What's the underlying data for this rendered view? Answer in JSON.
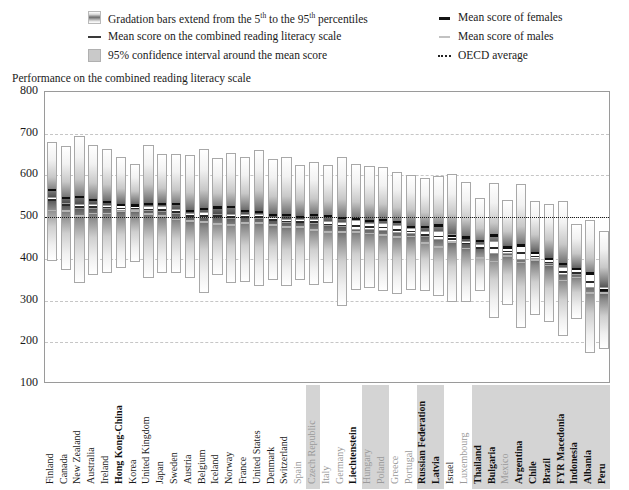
{
  "legend": {
    "items_left": [
      {
        "swatch": "gradient-swatch",
        "text_html": "Gradation bars extend from the 5th to the 95th percentiles",
        "text": "Gradation bars extend from the 5",
        "sup1": "th",
        "mid": " to the 95",
        "sup2": "th",
        "tail": " percentiles"
      },
      {
        "swatch": "mean-line-swatch",
        "text": "Mean score on the combined reading literacy scale"
      },
      {
        "swatch": "confidence-interval-swatch",
        "text": "95% confidence interval around the mean score"
      }
    ],
    "items_right": [
      {
        "swatch": "female-mean-swatch",
        "text": "Mean score of females"
      },
      {
        "swatch": "male-mean-swatch",
        "text": "Mean score of males"
      },
      {
        "swatch": "oecd-average-swatch",
        "text": "OECD average"
      }
    ]
  },
  "axis_title": "Performance on the combined reading literacy scale",
  "chart_data": {
    "type": "bar",
    "title": "Performance on the combined reading literacy scale",
    "subtitle": "PISA 2000 — combined reading literacy scale, 5th to 95th percentile gradation bars",
    "xlabel": "",
    "ylabel": "Performance on the combined reading literacy scale",
    "ylim": [
      100,
      800
    ],
    "yticks": [
      100,
      200,
      300,
      400,
      500,
      600,
      700,
      800
    ],
    "grid": true,
    "legend_position": "top",
    "oecd_average": 500,
    "value_keys": [
      "p5",
      "p95",
      "mean",
      "ci_low",
      "ci_high",
      "female",
      "male"
    ],
    "categories": [
      "Finland",
      "Canada",
      "New Zealand",
      "Australia",
      "Ireland",
      "Hong Kong-China",
      "Korea",
      "United Kingdom",
      "Japan",
      "Sweden",
      "Austria",
      "Belgium",
      "Iceland",
      "Norway",
      "France",
      "United States",
      "Denmark",
      "Switzerland",
      "Spain",
      "Czech Republic",
      "Italy",
      "Germany",
      "Liechtenstein",
      "Hungary",
      "Poland",
      "Greece",
      "Portugal",
      "Russian Federation",
      "Latvia",
      "Israel",
      "Luxembourg",
      "Thailand",
      "Bulgaria",
      "Mexico",
      "Argentina",
      "Chile",
      "Brazil",
      "FYR Macedonia",
      "Indonesia",
      "Albania",
      "Peru"
    ],
    "bold_labels": [
      "Hong Kong-China",
      "Liechtenstein",
      "Russian Federation",
      "Latvia",
      "Thailand",
      "Bulgaria",
      "Argentina",
      "Chile",
      "Brazil",
      "FYR Macedonia",
      "Indonesia",
      "Albania",
      "Peru"
    ],
    "dim_labels": [
      "Hungary",
      "Poland",
      "Greece",
      "Portugal",
      "Luxembourg",
      "Mexico",
      "Italy",
      "Germany",
      "Czech Republic",
      "Spain"
    ],
    "highlight_groups": [
      {
        "from": "Czech Republic",
        "to": "Czech Republic"
      },
      {
        "from": "Hungary",
        "to": "Poland"
      },
      {
        "from": "Russian Federation",
        "to": "Latvia"
      },
      {
        "from": "Thailand",
        "to": "Peru"
      }
    ],
    "rows": [
      {
        "country": "Finland",
        "p5": 394,
        "p95": 681,
        "mean": 546,
        "ci_low": 541,
        "ci_high": 551,
        "female": 571,
        "male": 520
      },
      {
        "country": "Canada",
        "p5": 374,
        "p95": 671,
        "mean": 534,
        "ci_low": 531,
        "ci_high": 537,
        "female": 551,
        "male": 519
      },
      {
        "country": "New Zealand",
        "p5": 341,
        "p95": 694,
        "mean": 529,
        "ci_low": 523,
        "ci_high": 535,
        "female": 553,
        "male": 507
      },
      {
        "country": "Australia",
        "p5": 362,
        "p95": 673,
        "mean": 528,
        "ci_low": 523,
        "ci_high": 533,
        "female": 546,
        "male": 513
      },
      {
        "country": "Ireland",
        "p5": 365,
        "p95": 664,
        "mean": 527,
        "ci_low": 522,
        "ci_high": 532,
        "female": 542,
        "male": 513
      },
      {
        "country": "Hong Kong-China",
        "p5": 379,
        "p95": 645,
        "mean": 525,
        "ci_low": 518,
        "ci_high": 532,
        "female": 534,
        "male": 518
      },
      {
        "country": "Korea",
        "p5": 393,
        "p95": 628,
        "mean": 525,
        "ci_low": 519,
        "ci_high": 531,
        "female": 533,
        "male": 519
      },
      {
        "country": "United Kingdom",
        "p5": 355,
        "p95": 672,
        "mean": 523,
        "ci_low": 518,
        "ci_high": 528,
        "female": 537,
        "male": 512
      },
      {
        "country": "Japan",
        "p5": 366,
        "p95": 652,
        "mean": 522,
        "ci_low": 515,
        "ci_high": 529,
        "female": 537,
        "male": 507
      },
      {
        "country": "Sweden",
        "p5": 367,
        "p95": 652,
        "mean": 516,
        "ci_low": 511,
        "ci_high": 521,
        "female": 536,
        "male": 499
      },
      {
        "country": "Austria",
        "p5": 355,
        "p95": 650,
        "mean": 507,
        "ci_low": 502,
        "ci_high": 512,
        "female": 520,
        "male": 495
      },
      {
        "country": "Belgium",
        "p5": 318,
        "p95": 663,
        "mean": 507,
        "ci_low": 500,
        "ci_high": 514,
        "female": 525,
        "male": 492
      },
      {
        "country": "Iceland",
        "p5": 361,
        "p95": 641,
        "mean": 507,
        "ci_low": 503,
        "ci_high": 511,
        "female": 528,
        "male": 488
      },
      {
        "country": "Norway",
        "p5": 343,
        "p95": 653,
        "mean": 505,
        "ci_low": 499,
        "ci_high": 511,
        "female": 529,
        "male": 486
      },
      {
        "country": "France",
        "p5": 344,
        "p95": 644,
        "mean": 505,
        "ci_low": 500,
        "ci_high": 510,
        "female": 519,
        "male": 490
      },
      {
        "country": "United States",
        "p5": 334,
        "p95": 660,
        "mean": 504,
        "ci_low": 497,
        "ci_high": 511,
        "female": 518,
        "male": 490
      },
      {
        "country": "Denmark",
        "p5": 350,
        "p95": 640,
        "mean": 497,
        "ci_low": 492,
        "ci_high": 502,
        "female": 510,
        "male": 485
      },
      {
        "country": "Switzerland",
        "p5": 336,
        "p95": 644,
        "mean": 494,
        "ci_low": 489,
        "ci_high": 499,
        "female": 510,
        "male": 480
      },
      {
        "country": "Spain",
        "p5": 349,
        "p95": 624,
        "mean": 493,
        "ci_low": 488,
        "ci_high": 498,
        "female": 505,
        "male": 481
      },
      {
        "country": "Czech Republic",
        "p5": 337,
        "p95": 633,
        "mean": 492,
        "ci_low": 486,
        "ci_high": 498,
        "female": 510,
        "male": 473
      },
      {
        "country": "Italy",
        "p5": 342,
        "p95": 625,
        "mean": 487,
        "ci_low": 481,
        "ci_high": 493,
        "female": 507,
        "male": 469
      },
      {
        "country": "Germany",
        "p5": 287,
        "p95": 645,
        "mean": 484,
        "ci_low": 478,
        "ci_high": 490,
        "female": 502,
        "male": 468
      },
      {
        "country": "Liechtenstein",
        "p5": 326,
        "p95": 627,
        "mean": 483,
        "ci_low": 471,
        "ci_high": 495,
        "female": 500,
        "male": 468
      },
      {
        "country": "Hungary",
        "p5": 330,
        "p95": 622,
        "mean": 480,
        "ci_low": 472,
        "ci_high": 488,
        "female": 496,
        "male": 465
      },
      {
        "country": "Poland",
        "p5": 323,
        "p95": 621,
        "mean": 479,
        "ci_low": 470,
        "ci_high": 488,
        "female": 498,
        "male": 461
      },
      {
        "country": "Greece",
        "p5": 316,
        "p95": 609,
        "mean": 474,
        "ci_low": 464,
        "ci_high": 484,
        "female": 493,
        "male": 456
      },
      {
        "country": "Portugal",
        "p5": 325,
        "p95": 602,
        "mean": 470,
        "ci_low": 463,
        "ci_high": 477,
        "female": 482,
        "male": 458
      },
      {
        "country": "Russian Federation",
        "p5": 322,
        "p95": 594,
        "mean": 462,
        "ci_low": 454,
        "ci_high": 470,
        "female": 481,
        "male": 443
      },
      {
        "country": "Latvia",
        "p5": 310,
        "p95": 598,
        "mean": 458,
        "ci_low": 447,
        "ci_high": 469,
        "female": 485,
        "male": 432
      },
      {
        "country": "Israel",
        "p5": 296,
        "p95": 604,
        "mean": 452,
        "ci_low": 442,
        "ci_high": 462,
        "female": 459,
        "male": 445
      },
      {
        "country": "Luxembourg",
        "p5": 296,
        "p95": 585,
        "mean": 441,
        "ci_low": 437,
        "ci_high": 445,
        "female": 456,
        "male": 429
      },
      {
        "country": "Thailand",
        "p5": 324,
        "p95": 546,
        "mean": 431,
        "ci_low": 425,
        "ci_high": 437,
        "female": 448,
        "male": 407
      },
      {
        "country": "Bulgaria",
        "p5": 259,
        "p95": 583,
        "mean": 430,
        "ci_low": 414,
        "ci_high": 446,
        "female": 461,
        "male": 398
      },
      {
        "country": "Mexico",
        "p5": 290,
        "p95": 541,
        "mean": 422,
        "ci_low": 414,
        "ci_high": 430,
        "female": 432,
        "male": 411
      },
      {
        "country": "Argentina",
        "p5": 235,
        "p95": 580,
        "mean": 418,
        "ci_low": 400,
        "ci_high": 436,
        "female": 437,
        "male": 396
      },
      {
        "country": "Chile",
        "p5": 265,
        "p95": 539,
        "mean": 410,
        "ci_low": 402,
        "ci_high": 418,
        "female": 419,
        "male": 401
      },
      {
        "country": "Brazil",
        "p5": 249,
        "p95": 531,
        "mean": 396,
        "ci_low": 389,
        "ci_high": 403,
        "female": 404,
        "male": 388
      },
      {
        "country": "FYR Macedonia",
        "p5": 214,
        "p95": 539,
        "mean": 373,
        "ci_low": 364,
        "ci_high": 382,
        "female": 393,
        "male": 352
      },
      {
        "country": "Indonesia",
        "p5": 255,
        "p95": 483,
        "mean": 371,
        "ci_low": 363,
        "ci_high": 379,
        "female": 380,
        "male": 360
      },
      {
        "country": "Albania",
        "p5": 175,
        "p95": 494,
        "mean": 349,
        "ci_low": 333,
        "ci_high": 365,
        "female": 370,
        "male": 322
      },
      {
        "country": "Peru",
        "p5": 183,
        "p95": 466,
        "mean": 327,
        "ci_low": 318,
        "ci_high": 336,
        "female": 331,
        "male": 323
      }
    ]
  }
}
